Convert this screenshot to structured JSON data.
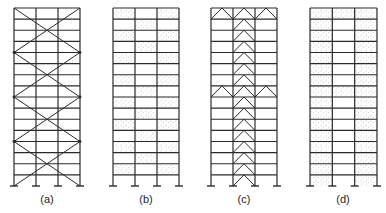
{
  "figure": {
    "stroke_color": "#2a2a2a",
    "stipple_color": "#8a8a8a",
    "background": "#ffffff",
    "storeys": 16,
    "top_y": 8,
    "base_y": 186,
    "frames": [
      {
        "id": "a",
        "label": "(a)",
        "x_left": 14,
        "x_right": 80,
        "system": "x-bracing",
        "bracing_zone_storeys": 4
      },
      {
        "id": "b",
        "label": "(b)",
        "x_left": 113,
        "x_right": 179,
        "system": "staggered-infill",
        "infill_rows": [
          [
            1,
            0,
            1
          ],
          [
            0,
            1,
            0
          ],
          [
            1,
            0,
            1
          ],
          [
            0,
            1,
            0
          ],
          [
            1,
            0,
            1
          ],
          [
            0,
            0,
            0
          ],
          [
            1,
            0,
            1
          ],
          [
            0,
            1,
            0
          ],
          [
            1,
            0,
            1
          ],
          [
            0,
            1,
            0
          ],
          [
            1,
            0,
            1
          ],
          [
            0,
            1,
            0
          ],
          [
            1,
            0,
            1
          ],
          [
            0,
            1,
            0
          ],
          [
            1,
            0,
            1
          ],
          [
            0,
            0,
            0
          ]
        ]
      },
      {
        "id": "c",
        "label": "(c)",
        "x_left": 211,
        "x_right": 277,
        "system": "chevron-core-with-outriggers",
        "core_bay": 1,
        "outrigger_storeys": [
          0,
          7
        ]
      },
      {
        "id": "d",
        "label": "(d)",
        "x_left": 310,
        "x_right": 377,
        "system": "infill-walls-with-outrigger-infill",
        "infill_rows": [
          [
            1,
            1,
            1
          ],
          [
            1,
            0,
            1
          ],
          [
            1,
            0,
            1
          ],
          [
            1,
            0,
            1
          ],
          [
            1,
            0,
            1
          ],
          [
            1,
            0,
            1
          ],
          [
            1,
            0,
            1
          ],
          [
            1,
            1,
            1
          ],
          [
            1,
            0,
            1
          ],
          [
            1,
            0,
            1
          ],
          [
            1,
            0,
            1
          ],
          [
            1,
            0,
            1
          ],
          [
            1,
            0,
            1
          ],
          [
            1,
            0,
            1
          ],
          [
            1,
            0,
            1
          ],
          [
            1,
            0,
            1
          ]
        ]
      }
    ]
  }
}
